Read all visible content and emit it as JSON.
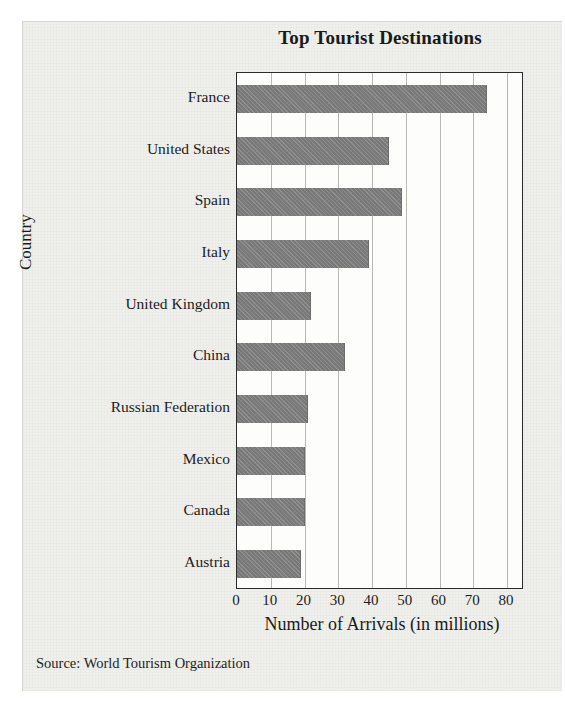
{
  "figure": {
    "source_note": "Source: World Tourism Organization"
  },
  "chart_data": {
    "type": "bar",
    "orientation": "horizontal",
    "title": "Top Tourist Destinations",
    "xlabel": "Number of Arrivals (in millions)",
    "ylabel": "Country",
    "categories": [
      "France",
      "United States",
      "Spain",
      "Italy",
      "United Kingdom",
      "China",
      "Russian Federation",
      "Mexico",
      "Canada",
      "Austria"
    ],
    "values": [
      74,
      45,
      49,
      39,
      22,
      32,
      21,
      20,
      20,
      19
    ],
    "xlim": [
      0,
      85
    ],
    "xticks": [
      0,
      10,
      20,
      30,
      40,
      50,
      60,
      70,
      80
    ],
    "xtick_labels": [
      "0",
      "10",
      "20",
      "30",
      "40",
      "50",
      "60",
      "70",
      "80"
    ],
    "grid": "vertical",
    "legend": "none",
    "bar_color": "#808080",
    "plot_border_color": "#2b2b2b",
    "gridline_color": "#b9b9b4"
  }
}
